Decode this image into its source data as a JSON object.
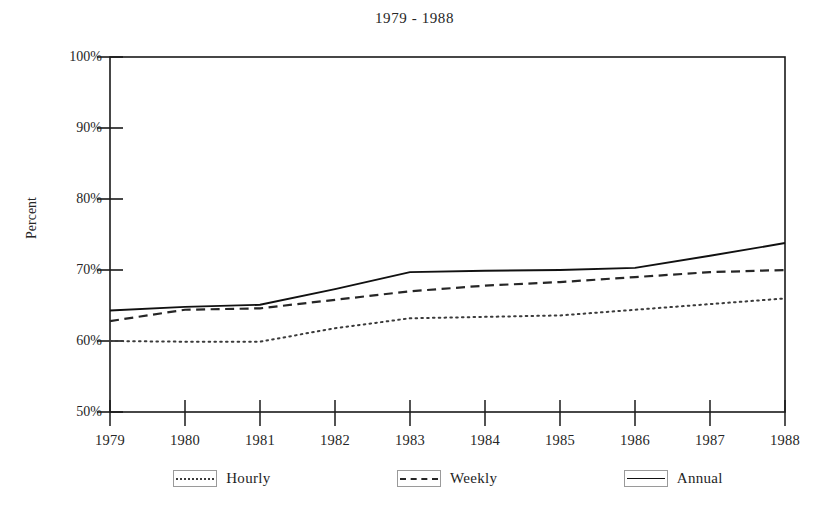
{
  "chart_data": {
    "type": "line",
    "title": "1979 - 1988",
    "xlabel": "",
    "ylabel": "Percent",
    "x": [
      1979,
      1980,
      1981,
      1982,
      1983,
      1984,
      1985,
      1986,
      1987,
      1988
    ],
    "xtick_labels": [
      "1979",
      "1980",
      "1981",
      "1982",
      "1983",
      "1984",
      "1985",
      "1986",
      "1987",
      "1988"
    ],
    "ytick_labels": [
      "100%",
      "90%",
      "80%",
      "70%",
      "60%",
      "50%"
    ],
    "yticks": [
      100,
      90,
      80,
      70,
      60,
      50
    ],
    "ylim": [
      50,
      100
    ],
    "xlim": [
      1979,
      1988
    ],
    "grid": false,
    "legend_position": "below",
    "series": [
      {
        "name": "Hourly",
        "style": "dotted",
        "color": "#3b3b3b",
        "values": [
          60.0,
          59.9,
          59.9,
          61.8,
          63.2,
          63.4,
          63.6,
          64.4,
          65.2,
          66.0
        ]
      },
      {
        "name": "Weekly",
        "style": "dashed",
        "color": "#262626",
        "values": [
          62.8,
          64.4,
          64.6,
          65.8,
          67.0,
          67.8,
          68.3,
          69.0,
          69.7,
          70.0
        ]
      },
      {
        "name": "Annual",
        "style": "solid",
        "color": "#111111",
        "values": [
          64.3,
          64.8,
          65.1,
          67.3,
          69.7,
          69.9,
          70.0,
          70.3,
          72.0,
          73.8
        ]
      }
    ]
  },
  "legend": {
    "items": [
      {
        "label": "Hourly"
      },
      {
        "label": "Weekly"
      },
      {
        "label": "Annual"
      }
    ]
  }
}
